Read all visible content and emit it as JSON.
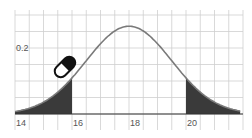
{
  "chart_data": {
    "type": "area",
    "title": "",
    "xlabel": "",
    "ylabel": "",
    "distribution": "normal",
    "mean": 18,
    "std": 1.5,
    "x_ticks": [
      "14",
      "16",
      "18",
      "20"
    ],
    "y_ticks": [
      "0.2"
    ],
    "xlim": [
      14,
      22
    ],
    "ylim": [
      0,
      0.3
    ],
    "grid": true,
    "shaded_regions": [
      {
        "from": 14,
        "to": 16,
        "label": "left tail"
      },
      {
        "from": 20,
        "to": 21.9,
        "label": "right tail"
      }
    ],
    "x": [
      14,
      15,
      16,
      17,
      18,
      19,
      20,
      21,
      22
    ],
    "values": [
      0.007,
      0.036,
      0.109,
      0.213,
      0.266,
      0.213,
      0.109,
      0.036,
      0.007
    ],
    "colors": {
      "curve": "#7a7a7a",
      "shade": "#3a3a3a",
      "grid": "#cfcfcf",
      "axis": "#333333"
    }
  },
  "annotations": {
    "icon": "pill-icon"
  }
}
